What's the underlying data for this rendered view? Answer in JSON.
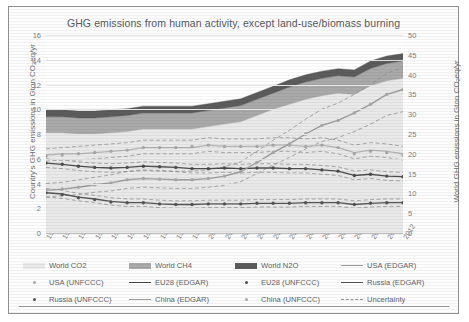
{
  "chart_data": {
    "type": "area",
    "title": "GHG emissions from human activity, except land-use/biomass burning",
    "xlabel": "",
    "ylabel": "Country's GHG emissions in Gton CO₂eq/yr",
    "ylabel_right": "World GHG emissions in Gton CO₂eq/yr",
    "categories": [
      1990,
      1991,
      1992,
      1993,
      1994,
      1995,
      1996,
      1997,
      1998,
      1999,
      2000,
      2001,
      2002,
      2003,
      2004,
      2005,
      2006,
      2007,
      2008,
      2009,
      2010,
      2011,
      2012
    ],
    "ylim": [
      0,
      16
    ],
    "yticks": [
      0,
      2,
      4,
      6,
      8,
      10,
      12,
      14,
      16
    ],
    "ylim_right": [
      0,
      50
    ],
    "yticks_right": [
      0,
      5,
      10,
      15,
      20,
      25,
      30,
      35,
      40,
      45,
      50
    ],
    "grid": true,
    "legend_position": "bottom",
    "stacked_areas": [
      {
        "name": "World CO2",
        "color": "#e9e9e9",
        "values_left": [
          8.1,
          8.1,
          8.0,
          8.0,
          8.1,
          8.2,
          8.4,
          8.4,
          8.4,
          8.4,
          8.6,
          8.8,
          9.0,
          9.5,
          10.0,
          10.4,
          10.8,
          11.1,
          11.3,
          11.2,
          11.9,
          12.3,
          12.5
        ]
      },
      {
        "name": "World CH4",
        "color": "#a9a9a9",
        "values_left": [
          1.3,
          1.3,
          1.3,
          1.3,
          1.3,
          1.3,
          1.3,
          1.3,
          1.3,
          1.3,
          1.3,
          1.3,
          1.3,
          1.3,
          1.3,
          1.4,
          1.4,
          1.4,
          1.4,
          1.4,
          1.4,
          1.4,
          1.4
        ]
      },
      {
        "name": "World N2O",
        "color": "#5c5c5c",
        "values_left": [
          0.55,
          0.55,
          0.55,
          0.55,
          0.55,
          0.55,
          0.55,
          0.55,
          0.55,
          0.55,
          0.55,
          0.55,
          0.55,
          0.55,
          0.55,
          0.58,
          0.58,
          0.58,
          0.58,
          0.58,
          0.6,
          0.6,
          0.6
        ]
      }
    ],
    "lines": [
      {
        "name": "USA (EDGAR)",
        "style": "solid",
        "color": "#b3b3b3",
        "values": [
          6.3,
          6.4,
          6.4,
          6.5,
          6.6,
          6.7,
          6.9,
          6.9,
          6.9,
          6.9,
          7.1,
          7.0,
          7.0,
          7.0,
          7.1,
          7.1,
          7.0,
          7.1,
          6.9,
          6.5,
          6.7,
          6.6,
          6.4
        ]
      },
      {
        "name": "USA (UNFCCC)",
        "style": "marker",
        "color": "#a8a8a8",
        "values": [
          6.2,
          6.3,
          6.4,
          6.5,
          6.6,
          6.7,
          6.9,
          6.9,
          6.9,
          7.0,
          7.1,
          7.0,
          7.0,
          7.0,
          7.1,
          7.1,
          7.0,
          7.1,
          6.9,
          6.4,
          6.6,
          6.5,
          6.3
        ]
      },
      {
        "name": "EU28 (EDGAR)",
        "style": "solid",
        "color": "#4d4d4d",
        "values": [
          5.65,
          5.55,
          5.4,
          5.3,
          5.25,
          5.3,
          5.4,
          5.35,
          5.3,
          5.2,
          5.2,
          5.25,
          5.2,
          5.25,
          5.25,
          5.2,
          5.2,
          5.1,
          5.0,
          4.65,
          4.75,
          4.6,
          4.55
        ]
      },
      {
        "name": "EU28 (UNFCCC)",
        "style": "marker",
        "color": "#4d4d4d",
        "values": [
          5.65,
          5.55,
          5.4,
          5.3,
          5.25,
          5.3,
          5.4,
          5.35,
          5.3,
          5.2,
          5.2,
          5.25,
          5.2,
          5.25,
          5.25,
          5.2,
          5.2,
          5.1,
          5.0,
          4.65,
          4.75,
          4.6,
          4.55
        ]
      },
      {
        "name": "Russia (EDGAR)",
        "style": "solid",
        "color": "#545454",
        "values": [
          3.25,
          3.15,
          2.9,
          2.75,
          2.55,
          2.45,
          2.45,
          2.35,
          2.3,
          2.3,
          2.35,
          2.35,
          2.35,
          2.4,
          2.4,
          2.4,
          2.45,
          2.45,
          2.45,
          2.3,
          2.4,
          2.45,
          2.45
        ]
      },
      {
        "name": "Russia (UNFCCC)",
        "style": "marker",
        "color": "#545454",
        "values": [
          3.25,
          3.1,
          2.85,
          2.7,
          2.5,
          2.45,
          2.45,
          2.35,
          2.3,
          2.3,
          2.35,
          2.35,
          2.35,
          2.4,
          2.4,
          2.4,
          2.45,
          2.45,
          2.45,
          2.3,
          2.4,
          2.45,
          2.45
        ]
      },
      {
        "name": "China (EDGAR)",
        "style": "solid",
        "color": "#9c9c9c",
        "values": [
          3.45,
          3.55,
          3.7,
          3.9,
          4.05,
          4.3,
          4.4,
          4.35,
          4.3,
          4.3,
          4.4,
          4.6,
          4.95,
          5.7,
          6.5,
          7.2,
          8.0,
          8.7,
          9.1,
          9.7,
          10.4,
          11.2,
          11.6
        ]
      },
      {
        "name": "China (UNFCCC)",
        "style": "marker",
        "color": "#a8a8a8",
        "values": [
          3.45,
          3.55,
          3.7,
          3.9,
          4.05,
          4.3,
          4.4,
          4.35,
          4.3,
          4.3,
          4.4,
          4.6,
          4.95,
          5.7,
          6.5,
          7.2,
          8.0,
          8.7,
          9.1,
          9.7,
          10.4,
          11.2,
          11.6
        ]
      }
    ],
    "uncertainty": {
      "name": "Uncertainty",
      "style": "dashed",
      "color": "#8f8f8f",
      "bands": [
        {
          "for": "USA",
          "upper": [
            6.8,
            6.9,
            7.0,
            7.1,
            7.2,
            7.3,
            7.5,
            7.5,
            7.5,
            7.5,
            7.7,
            7.6,
            7.6,
            7.6,
            7.7,
            7.7,
            7.6,
            7.7,
            7.5,
            7.1,
            7.3,
            7.2,
            7.0
          ],
          "lower": [
            5.8,
            5.9,
            5.9,
            6.0,
            6.1,
            6.2,
            6.4,
            6.4,
            6.4,
            6.4,
            6.6,
            6.5,
            6.5,
            6.5,
            6.6,
            6.6,
            6.5,
            6.6,
            6.4,
            6.0,
            6.2,
            6.1,
            5.9
          ]
        },
        {
          "for": "EU28",
          "upper": [
            6.0,
            5.9,
            5.75,
            5.65,
            5.6,
            5.65,
            5.75,
            5.7,
            5.65,
            5.55,
            5.55,
            5.6,
            5.55,
            5.6,
            5.6,
            5.55,
            5.55,
            5.45,
            5.35,
            5.0,
            5.1,
            4.95,
            4.9
          ],
          "lower": [
            5.3,
            5.2,
            5.05,
            4.95,
            4.9,
            4.95,
            5.05,
            5.0,
            4.95,
            4.85,
            4.85,
            4.9,
            4.85,
            4.9,
            4.9,
            4.85,
            4.85,
            4.75,
            4.65,
            4.3,
            4.4,
            4.25,
            4.2
          ]
        },
        {
          "for": "Russia",
          "upper": [
            3.6,
            3.45,
            3.2,
            3.05,
            2.85,
            2.75,
            2.75,
            2.65,
            2.6,
            2.6,
            2.65,
            2.65,
            2.65,
            2.7,
            2.7,
            2.7,
            2.75,
            2.75,
            2.75,
            2.6,
            2.7,
            2.75,
            2.75
          ],
          "lower": [
            2.9,
            2.8,
            2.6,
            2.45,
            2.25,
            2.15,
            2.15,
            2.05,
            2.0,
            2.0,
            2.05,
            2.05,
            2.05,
            2.1,
            2.1,
            2.1,
            2.15,
            2.15,
            2.15,
            2.0,
            2.1,
            2.15,
            2.15
          ]
        },
        {
          "for": "China",
          "upper": [
            4.0,
            4.1,
            4.3,
            4.5,
            4.7,
            5.0,
            5.1,
            5.05,
            5.0,
            5.0,
            5.1,
            5.35,
            5.75,
            6.6,
            7.5,
            8.3,
            9.2,
            10.0,
            10.5,
            11.2,
            12.0,
            12.9,
            13.4
          ],
          "lower": [
            2.9,
            3.0,
            3.1,
            3.3,
            3.4,
            3.6,
            3.7,
            3.65,
            3.6,
            3.6,
            3.7,
            3.85,
            4.15,
            4.8,
            5.5,
            6.1,
            6.8,
            7.4,
            7.7,
            8.2,
            8.8,
            9.5,
            9.8
          ]
        }
      ]
    }
  },
  "legend": {
    "items": [
      {
        "label": "World CO2",
        "marker": "area",
        "color": "#e9e9e9"
      },
      {
        "label": "World CH4",
        "marker": "area",
        "color": "#a9a9a9"
      },
      {
        "label": "World N2O",
        "marker": "area",
        "color": "#5c5c5c"
      },
      {
        "label": "USA (EDGAR)",
        "marker": "line",
        "color": "#9a9a9a"
      },
      {
        "label": "USA (UNFCCC)",
        "marker": "dot",
        "color": "#a8a8a8"
      },
      {
        "label": "EU28 (EDGAR)",
        "marker": "line",
        "color": "#4a4a4a"
      },
      {
        "label": "EU28 (UNFCCC)",
        "marker": "dot",
        "color": "#4d4d4d"
      },
      {
        "label": "Russia (EDGAR)",
        "marker": "line",
        "color": "#545454"
      },
      {
        "label": "Russia (UNFCCC)",
        "marker": "dot",
        "color": "#545454"
      },
      {
        "label": "China (EDGAR)",
        "marker": "line",
        "color": "#9c9c9c"
      },
      {
        "label": "China (UNFCCC)",
        "marker": "dot",
        "color": "#a8a8a8"
      },
      {
        "label": "Uncertainty",
        "marker": "dashed",
        "color": "#8f8f8f"
      }
    ]
  }
}
